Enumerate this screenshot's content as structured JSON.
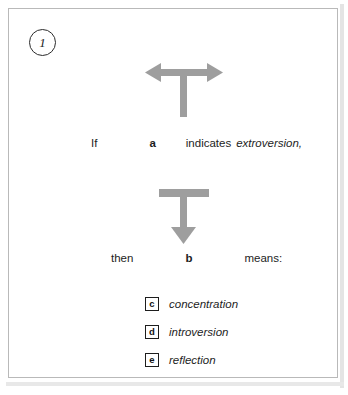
{
  "item": {
    "number": "1",
    "number_icon": "circled-number"
  },
  "symbols": {
    "premise": {
      "name": "t-shape-with-double-horizontal-arrow",
      "color": "#9e9e9e",
      "meaning_label": "a"
    },
    "conclusion": {
      "name": "t-shape-with-down-arrow",
      "color": "#9e9e9e",
      "meaning_label": "b"
    }
  },
  "premise_row": {
    "if": "If",
    "key": "a",
    "verb": "indicates",
    "term": "extroversion,"
  },
  "conclusion_row": {
    "then": "then",
    "key": "b",
    "verb": "means:"
  },
  "options": [
    {
      "key": "c",
      "label": "concentration"
    },
    {
      "key": "d",
      "label": "introversion"
    },
    {
      "key": "e",
      "label": "reflection"
    }
  ],
  "colors": {
    "symbol_gray": "#9e9e9e",
    "frame_border": "#b9b9b9",
    "text": "#1d1d1d",
    "background": "#ffffff"
  }
}
